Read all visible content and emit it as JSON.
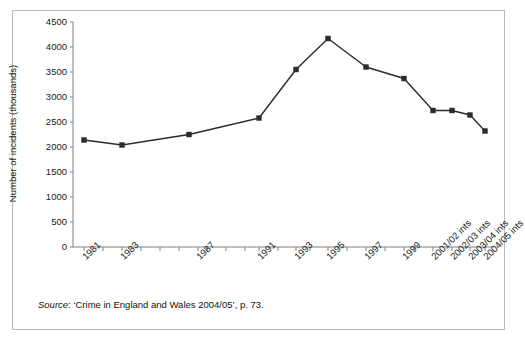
{
  "figure": {
    "source_note_prefix": "Source",
    "source_note_rest": ": ‘Crime in England and Wales 2004/05’, p. 73."
  },
  "chart_data": {
    "type": "line",
    "title": "",
    "xlabel": "",
    "ylabel": "Number of incidents (thousands)",
    "ylim": [
      0,
      4500
    ],
    "ytick_step": 500,
    "yticks": [
      "0",
      "500",
      "1000",
      "1500",
      "2000",
      "2500",
      "3000",
      "3500",
      "4000",
      "4500"
    ],
    "grid": false,
    "legend": "none",
    "marker": "square",
    "line_color": "#2b2b2b",
    "marker_color": "#2b2b2b",
    "axis_color": "#808080",
    "categories": [
      "1981",
      "1983",
      "1987",
      "1991",
      "1993",
      "1995",
      "1997",
      "1999",
      "2001/02 ints",
      "2002/03 ints",
      "2003/04 ints",
      "2004/05 ints"
    ],
    "tick_labels_all": [
      "1981",
      "",
      "1983",
      "",
      "",
      "",
      "1987",
      "",
      "",
      "",
      "1991",
      "",
      "1993",
      "",
      "1995",
      "",
      "1997",
      "",
      "1999",
      "",
      "2001/02 ints",
      "2002/03 ints",
      "2003/04 ints",
      "2004/05 ints"
    ],
    "values": [
      2140,
      2040,
      2250,
      2580,
      3550,
      4170,
      3600,
      3370,
      2730,
      2730,
      2640,
      2320
    ],
    "points": [
      {
        "x": "1981",
        "y": 2140
      },
      {
        "x": "1983",
        "y": 2040
      },
      {
        "x": "1987",
        "y": 2250
      },
      {
        "x": "1991",
        "y": 2580
      },
      {
        "x": "1993",
        "y": 3550
      },
      {
        "x": "1995",
        "y": 4170
      },
      {
        "x": "1997",
        "y": 3600
      },
      {
        "x": "1999",
        "y": 3370
      },
      {
        "x": "2001/02 ints",
        "y": 2730
      },
      {
        "x": "2002/03 ints",
        "y": 2730
      },
      {
        "x": "2003/04 ints",
        "y": 2640
      },
      {
        "x": "2004/05 ints",
        "y": 2320
      }
    ]
  },
  "geometry": {
    "x0": 73,
    "y0": 247,
    "ytop": 22,
    "ymax": 4500,
    "tick_x": [
      84,
      122,
      141,
      160,
      179,
      189,
      207,
      226,
      245,
      254,
      259,
      278,
      296,
      310,
      328,
      347,
      366,
      385,
      404,
      414,
      433,
      452,
      470,
      485
    ],
    "point_x": [
      84,
      122,
      189,
      259,
      296,
      328,
      366,
      404,
      433,
      452,
      470,
      485
    ],
    "axis_tick_xs": [
      84,
      103,
      122,
      141,
      160,
      179,
      198,
      207,
      226,
      245,
      259,
      278,
      296,
      310,
      328,
      347,
      366,
      385,
      404,
      414,
      433,
      452,
      470,
      485
    ]
  }
}
